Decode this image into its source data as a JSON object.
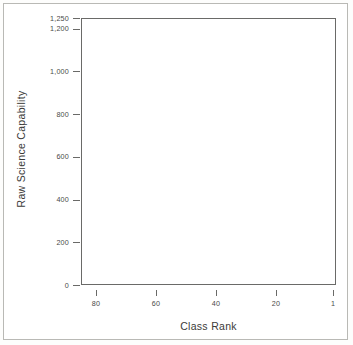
{
  "figure": {
    "background_color": "#ffffff",
    "frame_color": "#6a6a68",
    "bar_color": "#8e8e8c"
  },
  "chart_data": {
    "type": "bar",
    "title": "",
    "xlabel": "Class Rank",
    "ylabel": "Raw Science Capability",
    "xlim": [
      85,
      0
    ],
    "ylim": [
      0,
      1250
    ],
    "grid": false,
    "legend": null,
    "x_axis_reversed": true,
    "y_ticks": [
      0,
      200,
      400,
      600,
      800,
      1000,
      1200,
      1250
    ],
    "y_tick_labels": [
      "0",
      "200",
      "400",
      "600",
      "800",
      "1,000",
      "1,200",
      "1,250"
    ],
    "x_ticks": [
      80,
      60,
      40,
      20,
      1
    ],
    "x_tick_labels": [
      "80",
      "60",
      "40",
      "20",
      "1"
    ],
    "categories": [
      85,
      84,
      83,
      82,
      81,
      80,
      79,
      78,
      77,
      76,
      75,
      74,
      73,
      72,
      71,
      70,
      69,
      68,
      67,
      66,
      65,
      64,
      63,
      62,
      61,
      60,
      59,
      58,
      57,
      56,
      55,
      54,
      53,
      52,
      51,
      50,
      49,
      48,
      47,
      46,
      45,
      44,
      43,
      42,
      41,
      40,
      39,
      38,
      37,
      36,
      35,
      34,
      33,
      32,
      31,
      30,
      29,
      28,
      27,
      26,
      25,
      24,
      23,
      22,
      21,
      20,
      19,
      18,
      17,
      16,
      15,
      14,
      13,
      12,
      11,
      10,
      9,
      8,
      7,
      6,
      5,
      4,
      3,
      2,
      1
    ],
    "values": [
      46,
      47,
      47,
      48,
      48,
      49,
      50,
      50,
      51,
      52,
      52,
      53,
      54,
      55,
      56,
      57,
      58,
      59,
      60,
      61,
      62,
      63,
      64,
      66,
      67,
      68,
      70,
      71,
      73,
      74,
      76,
      78,
      80,
      82,
      84,
      86,
      88,
      90,
      93,
      95,
      98,
      101,
      104,
      107,
      110,
      114,
      118,
      122,
      126,
      131,
      136,
      141,
      147,
      153,
      160,
      167,
      175,
      183,
      192,
      202,
      213,
      225,
      238,
      252,
      268,
      285,
      304,
      325,
      348,
      374,
      403,
      435,
      471,
      512,
      558,
      610,
      669,
      736,
      812,
      898,
      960,
      1010,
      1080,
      1170,
      1240
    ]
  },
  "axis_titles": {
    "y": "Raw Science Capability",
    "x": "Class Rank"
  }
}
